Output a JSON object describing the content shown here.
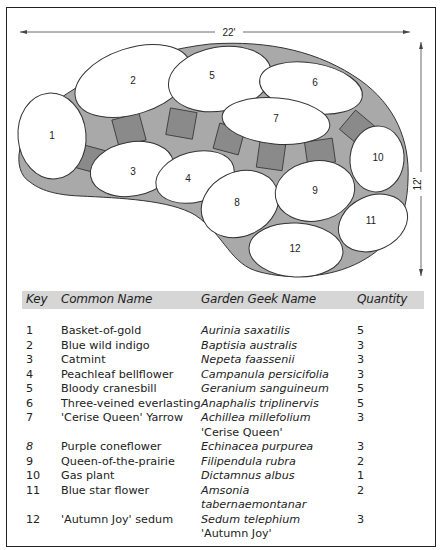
{
  "diagram": {
    "width_label": "22'",
    "height_label": "12'",
    "bed_fill": "#a9a9a9",
    "stone_fill": "#8a8a8a",
    "plant_fill": "#ffffff",
    "plant_labels": [
      "1",
      "2",
      "3",
      "4",
      "5",
      "6",
      "7",
      "8",
      "9",
      "10",
      "11",
      "12"
    ]
  },
  "table": {
    "headers": {
      "key": "Key",
      "common": "Common Name",
      "scientific": "Garden Geek Name",
      "quantity": "Quantity"
    },
    "header_bg": "#d6d6d6",
    "rows": [
      {
        "key": "1",
        "common": "Basket-of-gold",
        "scientific": "Aurinia saxatilis",
        "cultivar": "",
        "quantity": "5"
      },
      {
        "key": "2",
        "common": "Blue wild indigo",
        "scientific": "Baptisia australis",
        "cultivar": "",
        "quantity": "3"
      },
      {
        "key": "3",
        "common": "Catmint",
        "scientific": "Nepeta faassenii",
        "cultivar": "",
        "quantity": "3"
      },
      {
        "key": "4",
        "common": "Peachleaf bellflower",
        "scientific": "Campanula persicifolia",
        "cultivar": "",
        "quantity": "3"
      },
      {
        "key": "5",
        "common": "Bloody cranesbill",
        "scientific": "Geranium sanguineum",
        "cultivar": "",
        "quantity": "5"
      },
      {
        "key": "6",
        "common": "Three-veined everlasting",
        "scientific": "Anaphalis triplinervis",
        "cultivar": "",
        "quantity": "5"
      },
      {
        "key": "7",
        "common": "'Cerise Queen' Yarrow",
        "scientific": "Achillea millefolium",
        "cultivar": "'Cerise Queen'",
        "quantity": "3"
      },
      {
        "key": "8",
        "common": "Purple coneflower",
        "scientific": "Echinacea purpurea",
        "cultivar": "",
        "quantity": "3"
      },
      {
        "key": "9",
        "common": "Queen-of-the-prairie",
        "scientific": "Filipendula rubra",
        "cultivar": "",
        "quantity": "2"
      },
      {
        "key": "10",
        "common": "Gas plant",
        "scientific": "Dictamnus albus",
        "cultivar": "",
        "quantity": "1"
      },
      {
        "key": "11",
        "common": "Blue star flower",
        "scientific": "Amsonia",
        "cultivar": "tabernaemontanar",
        "quantity": "2"
      },
      {
        "key": "12",
        "common": "'Autumn Joy' sedum",
        "scientific": "Sedum telephium",
        "cultivar": "'Autumn Joy'",
        "quantity": "3"
      }
    ]
  }
}
